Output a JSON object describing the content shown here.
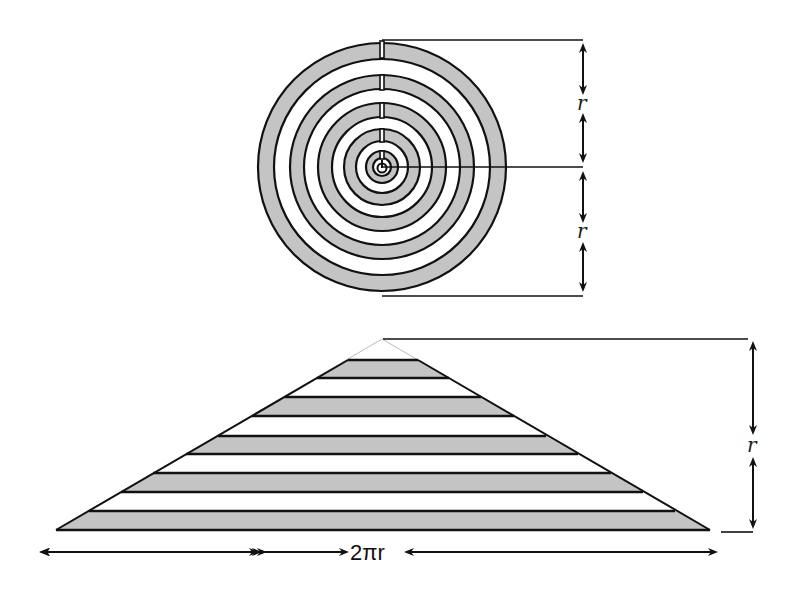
{
  "diagram": {
    "colors": {
      "ring_fill": "#c4c4c4",
      "stroke": "#111111",
      "background": "#ffffff"
    },
    "circle": {
      "center": [
        382,
        167
      ],
      "outer_radius": 127,
      "ring_count": 8,
      "label_upper": "r",
      "label_lower": "r"
    },
    "triangle": {
      "apex": [
        382,
        339
      ],
      "base_y": 530,
      "base_left_x": 56,
      "base_right_x": 710,
      "stripe_count": 9,
      "height_label": "r",
      "base_label": "2πr"
    }
  }
}
